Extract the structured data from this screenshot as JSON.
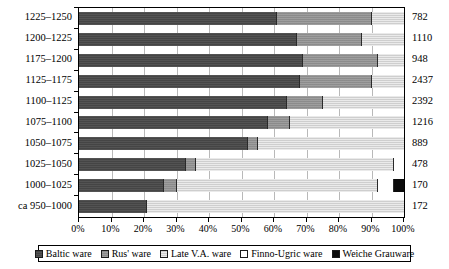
{
  "chart_data": {
    "type": "bar",
    "orientation": "horizontal",
    "stacked": true,
    "normalized_percent": true,
    "title": "",
    "xlabel": "",
    "ylabel": "",
    "xlim": [
      0,
      100
    ],
    "grid": true,
    "legend_position": "bottom",
    "categories": [
      "1225–1250",
      "1200–1225",
      "1175–1200",
      "1125–1175",
      "1100–1125",
      "1075–1100",
      "1050–1075",
      "1025–1050",
      "1000–1025",
      "ca 950–1000"
    ],
    "series": [
      {
        "name": "Baltic ware",
        "color": "#4a4a4a",
        "values": [
          61,
          67,
          69,
          68,
          64,
          58,
          52,
          33,
          26,
          21
        ]
      },
      {
        "name": "Rus' ware",
        "color": "#949494",
        "values": [
          29,
          20,
          23,
          22,
          11,
          7,
          3,
          3,
          4,
          0
        ]
      },
      {
        "name": "Late V.A. ware",
        "color": "#d9d9d9",
        "values": [
          10,
          13,
          8,
          10,
          25,
          35,
          45,
          61,
          62,
          79
        ]
      },
      {
        "name": "Finno-Ugric ware",
        "color": "#ffffff",
        "values": [
          0,
          0,
          0,
          0,
          0,
          0,
          0,
          3,
          5,
          0
        ]
      },
      {
        "name": "Weiche Grauware",
        "color": "#0b0b0b",
        "values": [
          0,
          0,
          0,
          0,
          0,
          0,
          0,
          0,
          3,
          0
        ]
      }
    ],
    "totals": [
      782,
      1110,
      948,
      2437,
      2392,
      1216,
      889,
      478,
      170,
      172
    ],
    "xticks": [
      0,
      10,
      20,
      30,
      40,
      50,
      60,
      70,
      80,
      90,
      100
    ],
    "xtick_labels": [
      "0%",
      "10%",
      "20%",
      "30%",
      "40%",
      "50%",
      "60%",
      "70%",
      "80%",
      "90%",
      "100%"
    ]
  },
  "legend": {
    "items": [
      {
        "label": "Baltic ware",
        "swatch": "baltic-swatch"
      },
      {
        "label": "Rus' ware",
        "swatch": "rus-swatch"
      },
      {
        "label": "Late V.A. ware",
        "swatch": "late-va-swatch"
      },
      {
        "label": "Finno-Ugric ware",
        "swatch": "finno-ugric-swatch"
      },
      {
        "label": "Weiche Grauware",
        "swatch": "weiche-grauware-swatch"
      }
    ]
  }
}
